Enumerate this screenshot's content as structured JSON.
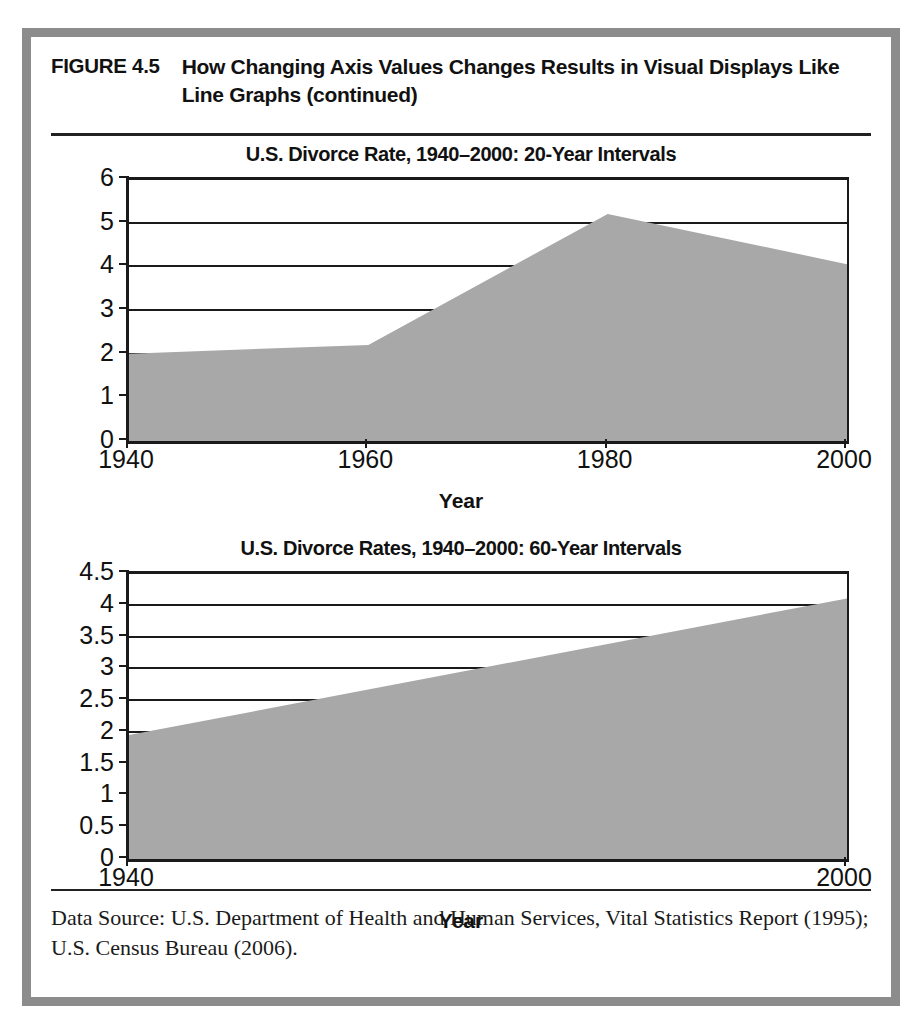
{
  "figure": {
    "label": "FIGURE 4.5",
    "title": "How Changing Axis Values Changes Results in Visual Displays Like Line Graphs (continued)",
    "source_note": "Data Source: U.S. Department of Health and Human Services, Vital Statistics Report (1995); U.S. Census Bureau (2006).",
    "frame_color": "#8c8c8c",
    "area_fill_color": "#a8a8a8",
    "axis_color": "#1a1a1a"
  },
  "chart_data": [
    {
      "type": "area",
      "title": "U.S. Divorce Rate, 1940–2000: 20-Year Intervals",
      "xlabel": "Year",
      "ylabel": "",
      "x": [
        1940,
        1960,
        1980,
        2000
      ],
      "values": [
        2.0,
        2.2,
        5.2,
        4.05
      ],
      "xlim": [
        1940,
        2000
      ],
      "ylim": [
        0,
        6
      ],
      "xticks": [
        1940,
        1960,
        1980,
        2000
      ],
      "xticklabels": [
        "1940",
        "1960",
        "1980",
        "2000"
      ],
      "yticks": [
        0,
        1,
        2,
        3,
        4,
        5,
        6
      ],
      "yticklabels": [
        "0",
        "1",
        "2",
        "3",
        "4",
        "5",
        "6"
      ],
      "grid": true,
      "legend": "none",
      "fill_color": "#a8a8a8"
    },
    {
      "type": "area",
      "title": "U.S. Divorce Rates, 1940–2000: 60-Year Intervals",
      "xlabel": "Year",
      "ylabel": "",
      "x": [
        1940,
        2000
      ],
      "values": [
        1.95,
        4.1
      ],
      "xlim": [
        1940,
        2000
      ],
      "ylim": [
        0,
        4.5
      ],
      "xticks": [
        1940,
        2000
      ],
      "xticklabels": [
        "1940",
        "2000"
      ],
      "yticks": [
        0,
        0.5,
        1,
        1.5,
        2,
        2.5,
        3,
        3.5,
        4,
        4.5
      ],
      "yticklabels": [
        "0",
        "0.5",
        "1",
        "1.5",
        "2",
        "2.5",
        "3",
        "3.5",
        "4",
        "4.5"
      ],
      "grid": true,
      "legend": "none",
      "fill_color": "#a8a8a8"
    }
  ]
}
